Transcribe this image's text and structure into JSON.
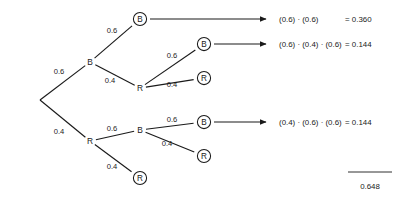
{
  "diagram": {
    "type": "probability-tree",
    "title": "",
    "root": {
      "label": "",
      "x": 40,
      "y": 100
    },
    "nodes": [
      {
        "id": "n-b1",
        "label": "B",
        "circled": false,
        "x": 90,
        "y": 62,
        "level": 1
      },
      {
        "id": "n-r1",
        "label": "R",
        "circled": false,
        "x": 90,
        "y": 141,
        "level": 1
      },
      {
        "id": "n-b1b",
        "label": "B",
        "circled": true,
        "x": 140,
        "y": 19,
        "level": 2
      },
      {
        "id": "n-b1r",
        "label": "R",
        "circled": false,
        "x": 140,
        "y": 88,
        "level": 2
      },
      {
        "id": "n-r1b",
        "label": "B",
        "circled": false,
        "x": 140,
        "y": 130,
        "level": 2
      },
      {
        "id": "n-r1r",
        "label": "R",
        "circled": true,
        "x": 140,
        "y": 178,
        "level": 2
      },
      {
        "id": "n-b1rb",
        "label": "B",
        "circled": true,
        "x": 204,
        "y": 44,
        "level": 3
      },
      {
        "id": "n-b1rr",
        "label": "R",
        "circled": true,
        "x": 204,
        "y": 78,
        "level": 3
      },
      {
        "id": "n-r1bb",
        "label": "B",
        "circled": true,
        "x": 204,
        "y": 122,
        "level": 3
      },
      {
        "id": "n-r1br",
        "label": "R",
        "circled": true,
        "x": 204,
        "y": 156,
        "level": 3
      }
    ],
    "edges": [
      {
        "id": "e-root-b1",
        "from": "root",
        "to": "n-b1",
        "weight": "0.6",
        "wx": 59,
        "wy": 71
      },
      {
        "id": "e-root-r1",
        "from": "root",
        "to": "n-r1",
        "weight": "0.4",
        "wx": 59,
        "wy": 131
      },
      {
        "id": "e-b1-b",
        "from": "n-b1",
        "to": "n-b1b",
        "weight": "0.6",
        "wx": 112,
        "wy": 30
      },
      {
        "id": "e-b1-r",
        "from": "n-b1",
        "to": "n-b1r",
        "weight": "0.4",
        "wx": 110,
        "wy": 80
      },
      {
        "id": "e-b1r-b",
        "from": "n-b1r",
        "to": "n-b1rb",
        "weight": "0.6",
        "wx": 172,
        "wy": 55
      },
      {
        "id": "e-b1r-r",
        "from": "n-b1r",
        "to": "n-b1rr",
        "weight": "0.4",
        "wx": 172,
        "wy": 84
      },
      {
        "id": "e-r1-b",
        "from": "n-r1",
        "to": "n-r1b",
        "weight": "0.6",
        "wx": 112,
        "wy": 128
      },
      {
        "id": "e-r1-r",
        "from": "n-r1",
        "to": "n-r1r",
        "weight": "0.4",
        "wx": 112,
        "wy": 166
      },
      {
        "id": "e-r1b-b",
        "from": "n-r1b",
        "to": "n-r1bb",
        "weight": "0.6",
        "wx": 172,
        "wy": 119
      },
      {
        "id": "e-r1b-r",
        "from": "n-r1b",
        "to": "n-r1br",
        "weight": "0.4",
        "wx": 167,
        "wy": 143
      }
    ],
    "outcomes": [
      {
        "id": "outcome-bb",
        "from_node": "n-b1b",
        "arrow": {
          "x1": 150,
          "y1": 19,
          "x2": 266,
          "y2": 19
        },
        "expression": "(0.6) · (0.6)",
        "expr_x": 279,
        "result": "= 0.360",
        "result_x": 345,
        "y": 19
      },
      {
        "id": "outcome-brb",
        "from_node": "n-b1rb",
        "arrow": {
          "x1": 214,
          "y1": 44,
          "x2": 266,
          "y2": 44
        },
        "expression": "(0.6) · (0.4) · (0.6)",
        "expr_x": 279,
        "result": "= 0.144",
        "result_x": 345,
        "y": 44
      },
      {
        "id": "outcome-rbb",
        "from_node": "n-r1bb",
        "arrow": {
          "x1": 214,
          "y1": 122,
          "x2": 266,
          "y2": 122
        },
        "expression": "(0.4) · (0.6) · (0.6)",
        "expr_x": 279,
        "result": "= 0.144",
        "result_x": 345,
        "y": 122
      }
    ],
    "total": {
      "value": "0.648",
      "rule": {
        "x1": 348,
        "y1": 172,
        "x2": 392,
        "y2": 172
      },
      "label_x": 370,
      "label_y": 186
    },
    "colors": {
      "stroke": "#1a1a1a",
      "text": "#1a1a1a",
      "background": "#ffffff"
    }
  }
}
